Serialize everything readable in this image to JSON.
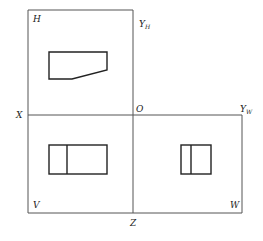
{
  "diagram": {
    "type": "three-view orthographic projection",
    "labels": {
      "H": "H",
      "V": "V",
      "W": "W",
      "X": "X",
      "Z": "Z",
      "O": "O",
      "YH_main": "Y",
      "YH_sub": "H",
      "YW_main": "Y",
      "YW_sub": "W"
    },
    "regions": [
      {
        "name": "H",
        "description": "horizontal projection plane (top view)"
      },
      {
        "name": "V",
        "description": "vertical projection plane (front view)"
      },
      {
        "name": "W",
        "description": "side projection plane (side view)"
      }
    ],
    "colors": {
      "frame": "#555555",
      "shape": "#222222",
      "background": "#ffffff"
    }
  }
}
